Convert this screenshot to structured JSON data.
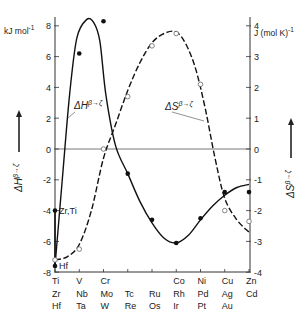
{
  "chart_data": {
    "type": "line",
    "title": "",
    "xlabel": "",
    "x_groups": [
      {
        "label": [
          "Ti",
          "Zr",
          "Hf"
        ]
      },
      {
        "label": [
          "V",
          "Nb",
          "Ta"
        ]
      },
      {
        "label": [
          "Cr",
          "Mo",
          "W"
        ]
      },
      {
        "label": [
          "",
          "Tc",
          "Re"
        ]
      },
      {
        "label": [
          "",
          "Ru",
          "Os"
        ]
      },
      {
        "label": [
          "Co",
          "Rh",
          "Ir"
        ]
      },
      {
        "label": [
          "Ni",
          "Pd",
          "Pt"
        ]
      },
      {
        "label": [
          "Cu",
          "Ag",
          "Au"
        ]
      },
      {
        "label": [
          "Zn",
          "Cd",
          ""
        ]
      }
    ],
    "left_axis": {
      "label": "ΔH^{β→ζ}",
      "unit": "kJ mol⁻¹",
      "ylim": [
        -8,
        8
      ],
      "ticks": [
        8,
        6,
        4,
        2,
        0,
        -2,
        -4,
        -6,
        -8
      ]
    },
    "right_axis": {
      "label": "ΔS^{β→ζ}",
      "unit": "J (mol K)⁻¹",
      "ylim": [
        -4,
        4
      ],
      "ticks": [
        4,
        3,
        2,
        1,
        0,
        -1,
        -2,
        -3,
        -4
      ]
    },
    "grid": false,
    "zero_line": true,
    "series": [
      {
        "name": "ΔH^{β→ζ}",
        "axis": "left",
        "style": "solid",
        "marker": "filled-circle",
        "points": [
          {
            "x": 0,
            "y": -4.0,
            "annotation": "Zr,Ti"
          },
          {
            "x": 0,
            "y": -7.6,
            "annotation": "Hf"
          },
          {
            "x": 1,
            "y": 6.2
          },
          {
            "x": 2,
            "y": 8.3
          },
          {
            "x": 3,
            "y": -1.6
          },
          {
            "x": 4,
            "y": -4.6
          },
          {
            "x": 5,
            "y": -6.1
          },
          {
            "x": 6,
            "y": -4.5
          },
          {
            "x": 7,
            "y": -2.8
          },
          {
            "x": 8,
            "y": -2.8
          }
        ],
        "curve": [
          [
            0,
            -7.6
          ],
          [
            0.3,
            -2
          ],
          [
            0.6,
            3.5
          ],
          [
            0.9,
            7.2
          ],
          [
            1.3,
            8.4
          ],
          [
            1.6,
            8.2
          ],
          [
            1.85,
            7.0
          ],
          [
            2.1,
            3.5
          ],
          [
            2.5,
            0.2
          ],
          [
            3.0,
            -1.6
          ],
          [
            3.5,
            -3.4
          ],
          [
            4.0,
            -4.8
          ],
          [
            4.5,
            -5.8
          ],
          [
            5.0,
            -6.1
          ],
          [
            5.5,
            -5.6
          ],
          [
            6.0,
            -4.6
          ],
          [
            6.5,
            -3.7
          ],
          [
            7.0,
            -3.0
          ],
          [
            7.5,
            -2.5
          ],
          [
            8.0,
            -2.3
          ]
        ]
      },
      {
        "name": "ΔS^{β→ζ}",
        "axis": "right",
        "style": "dashed",
        "marker": "open-circle",
        "points": [
          {
            "x": 0,
            "y": -3.6
          },
          {
            "x": 1,
            "y": -3.25
          },
          {
            "x": 2,
            "y": 0.0
          },
          {
            "x": 3,
            "y": 1.7
          },
          {
            "x": 4,
            "y": 3.35
          },
          {
            "x": 5,
            "y": 3.75
          },
          {
            "x": 6,
            "y": 2.1
          },
          {
            "x": 7,
            "y": -2.0
          },
          {
            "x": 8,
            "y": -2.35
          }
        ],
        "curve": [
          [
            0,
            -3.6
          ],
          [
            0.5,
            -3.5
          ],
          [
            1.0,
            -3.1
          ],
          [
            1.5,
            -2.0
          ],
          [
            2.0,
            -0.3
          ],
          [
            2.5,
            0.8
          ],
          [
            3.0,
            1.9
          ],
          [
            3.5,
            2.8
          ],
          [
            4.0,
            3.45
          ],
          [
            4.5,
            3.75
          ],
          [
            5.0,
            3.8
          ],
          [
            5.4,
            3.4
          ],
          [
            5.8,
            2.6
          ],
          [
            6.2,
            1.3
          ],
          [
            6.6,
            -0.3
          ],
          [
            7.0,
            -1.6
          ],
          [
            7.5,
            -2.3
          ],
          [
            8.0,
            -2.7
          ]
        ]
      }
    ],
    "annotations": [
      {
        "text": "ΔH^{β→ζ}",
        "target_series": 0
      },
      {
        "text": "ΔS^{β→ζ}",
        "target_series": 1
      }
    ]
  },
  "labels": {
    "left_unit": "kJ mol",
    "left_unit_sup": "-1",
    "right_unit": "J (mol K)",
    "right_unit_sup": "-1",
    "dH_label_main": "ΔH",
    "dH_label_sup": "β→ζ",
    "dS_label_main": "ΔS",
    "dS_label_sup": "β→ζ",
    "zr_ti": "Zr,Ti",
    "hf": "Hf"
  }
}
